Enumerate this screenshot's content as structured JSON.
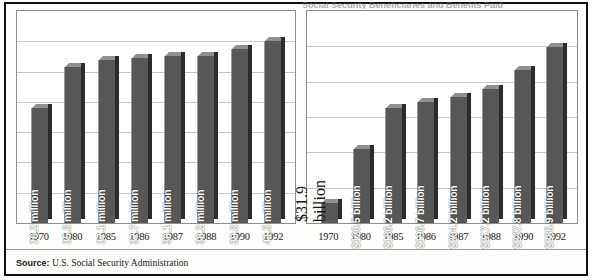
{
  "figure": {
    "cut_title": "Social Security Beneficiaries and Benefits Paid",
    "source_label": "Source:",
    "source_text": "U.S. Social Security Administration"
  },
  "chart_data": [
    {
      "type": "bar",
      "title": "",
      "xlabel": "",
      "ylabel": "",
      "grid": true,
      "legend": "none",
      "ylim": [
        0,
        45
      ],
      "categories": [
        "1970",
        "1980",
        "1985",
        "1986",
        "1987",
        "1988",
        "1990",
        "1992"
      ],
      "values": [
        26.2,
        35.6,
        37.1,
        37.7,
        38.1,
        38.2,
        39.8,
        41.5
      ],
      "data_labels": [
        "26.2 million",
        "35.6 million",
        "37.1 million",
        "37.7 million",
        "38.1 million",
        "38.2 million",
        "39.8 million",
        "41.5 million"
      ],
      "label_placement": [
        "inside",
        "inside",
        "inside",
        "inside",
        "inside",
        "inside",
        "inside",
        "inside"
      ]
    },
    {
      "type": "bar",
      "title": "",
      "xlabel": "",
      "ylabel": "",
      "grid": true,
      "legend": "none",
      "ylim": [
        0,
        320
      ],
      "categories": [
        "1970",
        "1980",
        "1985",
        "1986",
        "1987",
        "1988",
        "1990",
        "1992"
      ],
      "values": [
        31.9,
        120.5,
        186.2,
        196.7,
        204.2,
        217.2,
        247.8,
        285.9
      ],
      "data_labels": [
        "$31.9 billion",
        "$120.5 billion",
        "$186.2 billion",
        "$196.7 billion",
        "$204.2 billion",
        "$217.2 billion",
        "$247.8 billion",
        "$285.9 billion"
      ],
      "label_placement": [
        "outside",
        "inside",
        "inside",
        "inside",
        "inside",
        "inside",
        "inside",
        "inside"
      ]
    }
  ],
  "colors": {
    "bar_face": "#575757",
    "bar_shadow": "#2b2b2b",
    "bar_top": "#8f8f8f",
    "grid": "#c8c8c8",
    "frame": "#111111",
    "label_inside": "#ffffff",
    "label_outside": "#141414"
  }
}
